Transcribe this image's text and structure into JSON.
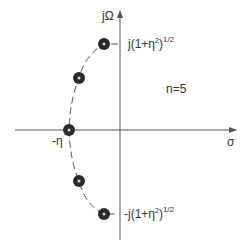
{
  "diagram": {
    "type": "pole-zero plot (s-plane)",
    "axes": {
      "vertical_label": "jΩ",
      "horizontal_label": "σ"
    },
    "annotations": {
      "order": "n=5",
      "real_pole": "-η",
      "top_pole_prefix": "j(1+η",
      "top_pole_sup2": "2",
      "top_pole_suffix": ")",
      "top_pole_exp": "1/2",
      "bottom_pole_prefix": "-j(1+η",
      "bottom_pole_sup2": "2",
      "bottom_pole_suffix": ")",
      "bottom_pole_exp": "1/2"
    },
    "poles": [
      {
        "id": "p1",
        "cx": 104,
        "cy": 44
      },
      {
        "id": "p2",
        "cx": 79,
        "cy": 78
      },
      {
        "id": "p3",
        "cx": 69,
        "cy": 130
      },
      {
        "id": "p4",
        "cx": 79,
        "cy": 181
      },
      {
        "id": "p5",
        "cx": 104,
        "cy": 214
      }
    ],
    "colors": {
      "axis": "#555555",
      "pole": "#2a2a2a",
      "curve": "#555555"
    }
  }
}
